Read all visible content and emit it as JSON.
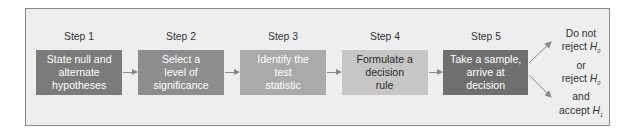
{
  "steps": [
    {
      "label": "Step 1",
      "text": "State null and alternate hypotheses",
      "lines": [
        "State null and",
        "alternate",
        "hypotheses"
      ],
      "fill": "#7b7b7b",
      "text_color": "#ffffff"
    },
    {
      "label": "Step 2",
      "text": "Select a level of significance",
      "lines": [
        "Select a",
        "level of",
        "significance"
      ],
      "fill": "#8d8d8d",
      "text_color": "#ffffff"
    },
    {
      "label": "Step 3",
      "text": "Identify the test statistic",
      "lines": [
        "Identify the",
        "test",
        "statistic"
      ],
      "fill": "#aaaaaa",
      "text_color": "#ffffff"
    },
    {
      "label": "Step 4",
      "text": "Formulate a decision rule",
      "lines": [
        "Formulate a",
        "decision",
        "rule"
      ],
      "fill": "#c6c6c6",
      "text_color": "#2a2a2a"
    },
    {
      "label": "Step 5",
      "text": "Take a sample, arrive at decision",
      "lines": [
        "Take a sample,",
        "arrive at",
        "decision"
      ],
      "fill": "#6f6f6f",
      "text_color": "#ffffff"
    }
  ],
  "outcome": {
    "line1": "Do not",
    "line2_prefix": "reject ",
    "line2_var": "H",
    "line2_sub": "0",
    "line3": "or",
    "line4_prefix": "reject ",
    "line4_var": "H",
    "line4_sub": "0",
    "line5": "and",
    "line6_prefix": "accept ",
    "line6_var": "H",
    "line6_sub": "1"
  },
  "colors": {
    "frame_bg": "#eeeeee",
    "frame_border": "#8a8a8a",
    "arrow": "#8a8a8a"
  }
}
